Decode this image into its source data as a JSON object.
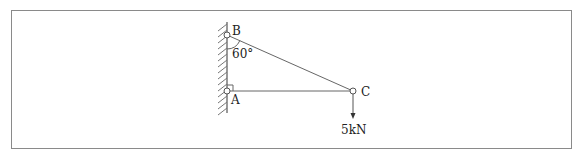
{
  "diagram": {
    "type": "truss-bracket",
    "points": {
      "B": {
        "label": "B"
      },
      "A": {
        "label": "A"
      },
      "C": {
        "label": "C"
      }
    },
    "angle": {
      "label": "60°",
      "at": "B"
    },
    "load": {
      "label": "5kN",
      "at": "C",
      "direction": "down"
    },
    "colors": {
      "line": "#666666",
      "frame": "#8a8a8a",
      "text": "#222222"
    }
  }
}
